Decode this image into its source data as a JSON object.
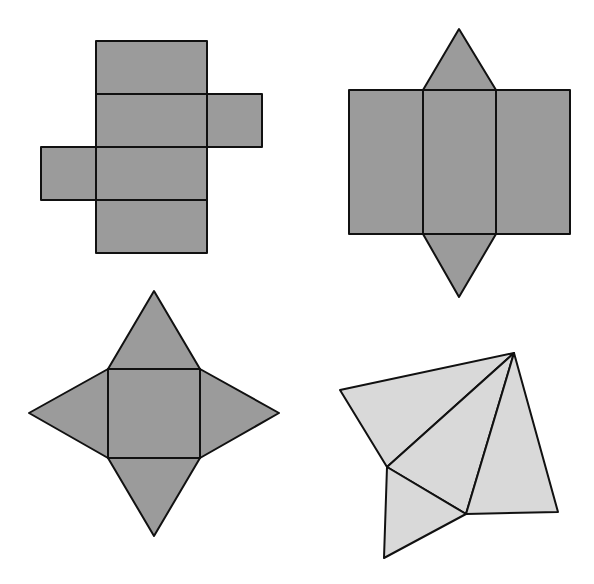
{
  "figure": {
    "width": 594,
    "height": 584,
    "background": "#ffffff",
    "stroke_color": "#111111",
    "colors": {
      "dark_fill": "#9b9b9b",
      "light_fill": "#d9d9d9"
    },
    "nets": [
      {
        "id": "cuboid-net",
        "description": "Net of a rectangular prism (cross shape)",
        "fill": "dark_fill",
        "faces": [
          {
            "type": "rect",
            "x": 96,
            "y": 41,
            "w": 111,
            "h": 53
          },
          {
            "type": "rect",
            "x": 96,
            "y": 94,
            "w": 111,
            "h": 53
          },
          {
            "type": "rect",
            "x": 207,
            "y": 94,
            "w": 55,
            "h": 53
          },
          {
            "type": "rect",
            "x": 41,
            "y": 147,
            "w": 55,
            "h": 53
          },
          {
            "type": "rect",
            "x": 96,
            "y": 147,
            "w": 111,
            "h": 53
          },
          {
            "type": "rect",
            "x": 96,
            "y": 200,
            "w": 111,
            "h": 53
          }
        ]
      },
      {
        "id": "triangular-prism-net",
        "description": "Net of a triangular prism",
        "fill": "dark_fill",
        "faces": [
          {
            "type": "polygon",
            "points": "423,90 459,29 496,90"
          },
          {
            "type": "rect",
            "x": 349,
            "y": 90,
            "w": 74,
            "h": 144
          },
          {
            "type": "rect",
            "x": 423,
            "y": 90,
            "w": 73,
            "h": 144
          },
          {
            "type": "rect",
            "x": 496,
            "y": 90,
            "w": 74,
            "h": 144
          },
          {
            "type": "polygon",
            "points": "423,234 459,297 496,234"
          }
        ]
      },
      {
        "id": "square-pyramid-net",
        "description": "Net of a square pyramid",
        "fill": "dark_fill",
        "faces": [
          {
            "type": "polygon",
            "points": "108,369 154,291 200,369"
          },
          {
            "type": "polygon",
            "points": "108,369 29,413 108,458"
          },
          {
            "type": "polygon",
            "points": "200,369 279,413 200,458"
          },
          {
            "type": "polygon",
            "points": "108,458 154,536 200,458"
          },
          {
            "type": "rect",
            "x": 108,
            "y": 369,
            "w": 92,
            "h": 89
          }
        ]
      },
      {
        "id": "tetrahedron-net",
        "description": "Net of a triangular pyramid (irregular)",
        "fill": "light_fill",
        "faces": [
          {
            "type": "polygon",
            "points": "340,390 514,353 387,467"
          },
          {
            "type": "polygon",
            "points": "387,467 514,353 466,514"
          },
          {
            "type": "polygon",
            "points": "466,514 514,353 558,512"
          },
          {
            "type": "polygon",
            "points": "387,467 466,514 384,558"
          }
        ]
      }
    ]
  }
}
